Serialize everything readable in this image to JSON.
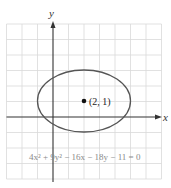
{
  "axes": {
    "x_label": "x",
    "y_label": "y"
  },
  "ellipse": {
    "equation": "4x² + 9y² − 16x − 18y − 11 = 0",
    "center_label": "(2, 1)",
    "center": [
      2,
      1
    ],
    "semi_major": 3,
    "semi_minor": 2,
    "stroke_color": "#555555"
  },
  "grid": {
    "x_range": [
      -3,
      7
    ],
    "y_range": [
      -4,
      6
    ],
    "color": "#d9d9d9"
  }
}
